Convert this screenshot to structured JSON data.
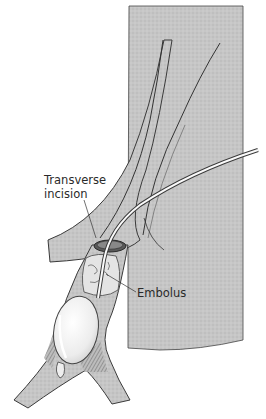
{
  "figure": {
    "labels": {
      "incision_line1": "Transverse",
      "incision_line2": "incision",
      "embolus": "Embolus"
    },
    "colors": {
      "tissue_fill": "#c4c4c4",
      "outline": "#3a3a3a",
      "balloon_fill": "#f2f2f2",
      "background": "#ffffff"
    }
  }
}
